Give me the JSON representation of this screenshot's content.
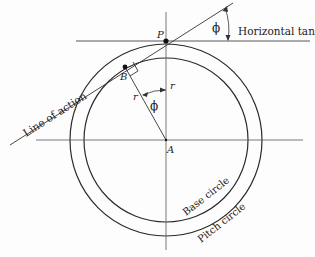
{
  "diagram": {
    "labels": {
      "point_p": "P",
      "point_b": "B",
      "point_a": "A",
      "phi_top": "ϕ",
      "phi_center": "ϕ",
      "r_left": "r",
      "r_right": "r",
      "horizontal_tangent": "Horizontal tangent",
      "line_of_action": "Line of action",
      "base_circle": "Base circle",
      "pitch_circle": "Pitch circle"
    },
    "colors": {
      "stroke": "#2a2a2a",
      "background": "#fdfdfd"
    }
  }
}
